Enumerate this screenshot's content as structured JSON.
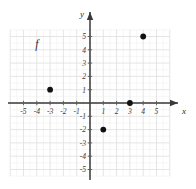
{
  "chart_data": {
    "type": "scatter",
    "title": "",
    "xlabel": "x",
    "ylabel": "y",
    "xlim": [
      -6,
      6
    ],
    "ylim": [
      -5.5,
      5.5
    ],
    "grid": true,
    "legend": "none",
    "series": [
      {
        "name": "f",
        "points": [
          {
            "x": -3,
            "y": 1
          },
          {
            "x": 1,
            "y": -2
          },
          {
            "x": 3,
            "y": 0
          },
          {
            "x": 4,
            "y": 5
          }
        ]
      }
    ],
    "annotations": [
      {
        "text": "f",
        "x": -4,
        "y": 4.1
      }
    ],
    "x_ticks": [
      -5,
      -4,
      -3,
      -2,
      -1,
      1,
      2,
      3,
      4,
      5
    ],
    "y_ticks": [
      5,
      4,
      3,
      2,
      1,
      -1,
      -2,
      -3,
      -4,
      -5
    ],
    "x_tick_labels": [
      "-5",
      "-4",
      "-3",
      "-2",
      "-1",
      "1",
      "2",
      "3",
      "4",
      "5"
    ],
    "y_tick_labels": [
      "5",
      "4",
      "3",
      "2",
      "1",
      "-1",
      "-2",
      "-3",
      "-4",
      "-5"
    ],
    "colors": {
      "point": "#111111",
      "axis": "#3a3a3a",
      "grid_major": "#e2e2e2",
      "grid_minor": "#f0f0f0",
      "background": "#ffffff",
      "text": "#3d3d3d"
    }
  },
  "axes": {
    "x_name": "x",
    "y_name": "y"
  },
  "function_label": {
    "text": "f"
  }
}
